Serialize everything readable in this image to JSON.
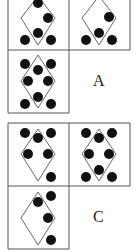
{
  "puzzle": {
    "grids": [
      {
        "name": "grid-top",
        "option_label": "A",
        "cells": [
          {
            "id": "top-left",
            "dots": [
              [
                38,
                3
              ],
              [
                48,
                18
              ],
              [
                38,
                33
              ],
              [
                25,
                40
              ],
              [
                51,
                40
              ]
            ]
          },
          {
            "id": "top-right",
            "dots": [
              [
                109,
                17
              ],
              [
                99,
                33
              ],
              [
                86,
                40
              ],
              [
                112,
                40
              ]
            ]
          },
          {
            "id": "bottom-left",
            "dots": [
              [
                25,
                64
              ],
              [
                51,
                64
              ],
              [
                38,
                70
              ],
              [
                28,
                81
              ],
              [
                48,
                81
              ],
              [
                38,
                97
              ],
              [
                25,
                104
              ],
              [
                51,
                104
              ]
            ]
          }
        ]
      },
      {
        "name": "grid-bottom",
        "option_label": "C",
        "cells": [
          {
            "id": "top-left",
            "dots": [
              [
                25,
                133
              ],
              [
                51,
                133
              ],
              [
                38,
                138
              ],
              [
                28,
                154
              ],
              [
                48,
                154
              ],
              [
                51,
                177
              ]
            ]
          },
          {
            "id": "top-right",
            "dots": [
              [
                86,
                133
              ],
              [
                112,
                133
              ],
              [
                99,
                138
              ],
              [
                89,
                154
              ],
              [
                109,
                154
              ],
              [
                99,
                170
              ],
              [
                86,
                177
              ],
              [
                112,
                177
              ]
            ]
          },
          {
            "id": "bottom-left",
            "dots": [
              [
                51,
                196
              ],
              [
                38,
                202
              ],
              [
                48,
                218
              ],
              [
                51,
                240
              ]
            ]
          }
        ]
      }
    ],
    "colors": {
      "line": "#555555",
      "dot": "#111111",
      "border": "#555555"
    }
  }
}
